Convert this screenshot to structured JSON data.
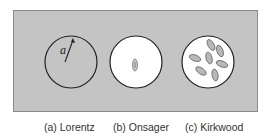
{
  "figure": {
    "panels": [
      {
        "id": "a",
        "caption": "(a) Lorentz",
        "fill": "#c4c4c4",
        "radius_label": "a"
      },
      {
        "id": "b",
        "caption": "(b) Onsager",
        "fill": "#ffffff",
        "dipoles": 1
      },
      {
        "id": "c",
        "caption": "(c) Kirkwood",
        "fill": "#ffffff",
        "dipoles": 7
      }
    ],
    "colors": {
      "background_panel": "#c4c4c4",
      "cavity_stroke": "#222222",
      "dipole_fill": "#b8b8b8"
    }
  }
}
